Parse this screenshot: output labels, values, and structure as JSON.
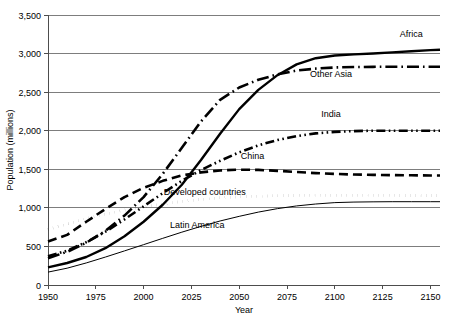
{
  "chart_data": {
    "type": "line",
    "title": "",
    "xlabel": "Year",
    "ylabel": "Population (millions)",
    "xlim": [
      1950,
      2155
    ],
    "ylim": [
      0,
      3500
    ],
    "grid": true,
    "legend_position": "inline-labels",
    "x_ticks": [
      "1950",
      "1975",
      "2000",
      "2025",
      "2050",
      "2075",
      "2100",
      "2125",
      "2150"
    ],
    "x_tick_values": [
      1950,
      1975,
      2000,
      2025,
      2050,
      2075,
      2100,
      2125,
      2150
    ],
    "y_ticks": [
      "0",
      "500",
      "1,000",
      "1,500",
      "2,000",
      "2,500",
      "3,000",
      "3,500"
    ],
    "y_tick_values": [
      0,
      500,
      1000,
      1500,
      2000,
      2500,
      3000,
      3500
    ],
    "x": [
      1950,
      1960,
      1970,
      1980,
      1990,
      2000,
      2010,
      2020,
      2030,
      2040,
      2050,
      2060,
      2070,
      2080,
      2090,
      2100,
      2110,
      2120,
      2130,
      2140,
      2150,
      2155
    ],
    "series": [
      {
        "name": "Africa",
        "label": "Africa",
        "style": "solid-thick",
        "label_x": 2140,
        "label_y": 3210,
        "values": [
          228,
          285,
          363,
          477,
          632,
          820,
          1040,
          1300,
          1620,
          1960,
          2280,
          2530,
          2720,
          2860,
          2940,
          2975,
          2990,
          3000,
          3015,
          3030,
          3045,
          3050
        ]
      },
      {
        "name": "Other Asia",
        "label": "Other Asia",
        "style": "dash-dot",
        "label_x": 2098,
        "label_y": 2700,
        "values": [
          348,
          430,
          548,
          700,
          900,
          1140,
          1440,
          1780,
          2120,
          2400,
          2560,
          2660,
          2730,
          2780,
          2805,
          2820,
          2825,
          2828,
          2830,
          2830,
          2830,
          2830
        ]
      },
      {
        "name": "India",
        "label": "India",
        "style": "dash-dot-dot",
        "label_x": 2098,
        "label_y": 2180,
        "values": [
          372,
          445,
          555,
          690,
          850,
          1020,
          1190,
          1350,
          1490,
          1610,
          1720,
          1810,
          1880,
          1930,
          1965,
          1985,
          1995,
          2000,
          2000,
          2000,
          2000,
          2000
        ]
      },
      {
        "name": "China",
        "label": "China",
        "style": "dashed",
        "label_x": 2057,
        "label_y": 1630,
        "values": [
          563,
          650,
          820,
          985,
          1140,
          1260,
          1350,
          1420,
          1460,
          1485,
          1495,
          1492,
          1480,
          1465,
          1450,
          1440,
          1432,
          1428,
          1424,
          1422,
          1420,
          1420
        ]
      },
      {
        "name": "Developed countries",
        "label": "Developed countries",
        "style": "dotted",
        "label_x": 2032,
        "label_y": 1170,
        "values": [
          720,
          790,
          860,
          920,
          970,
          1010,
          1050,
          1085,
          1110,
          1130,
          1145,
          1152,
          1158,
          1162,
          1164,
          1165,
          1164,
          1163,
          1162,
          1161,
          1160,
          1160
        ]
      },
      {
        "name": "Latin America",
        "label": "Latin America",
        "style": "solid-thin",
        "label_x": 2028,
        "label_y": 740,
        "values": [
          167,
          218,
          286,
          362,
          442,
          523,
          605,
          685,
          760,
          830,
          890,
          945,
          990,
          1025,
          1050,
          1068,
          1075,
          1078,
          1080,
          1080,
          1080,
          1080
        ]
      }
    ]
  }
}
